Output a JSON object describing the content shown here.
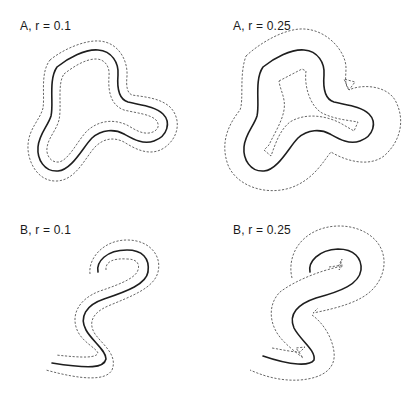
{
  "figure": {
    "panels": [
      {
        "id": "A-0.1",
        "label": "A, r = 0.1",
        "curve": "A",
        "r": "0.1",
        "description": "Closed three-lobed curve with inner and outer offset curves at distance r"
      },
      {
        "id": "A-0.25",
        "label": "A, r = 0.25",
        "curve": "A",
        "r": "0.25",
        "description": "Closed three-lobed curve with offset curves; inner offset self-intersects forming cusps/swallowtails"
      },
      {
        "id": "B-0.1",
        "label": "B, r = 0.1",
        "curve": "B",
        "r": "0.1",
        "description": "Open S-shaped curve with two offset curves at distance r"
      },
      {
        "id": "B-0.25",
        "label": "B, r = 0.25",
        "curve": "B",
        "r": "0.25",
        "description": "Open S-shaped curve with offset curves showing cusps and self-intersections"
      }
    ],
    "legend": {
      "solid": "original curve",
      "dashed": "offset curves"
    },
    "colors": {
      "background": "#ffffff",
      "solid_stroke": "#1e1e1e",
      "dashed_stroke": "#555555",
      "text": "#1a1a1a"
    }
  }
}
